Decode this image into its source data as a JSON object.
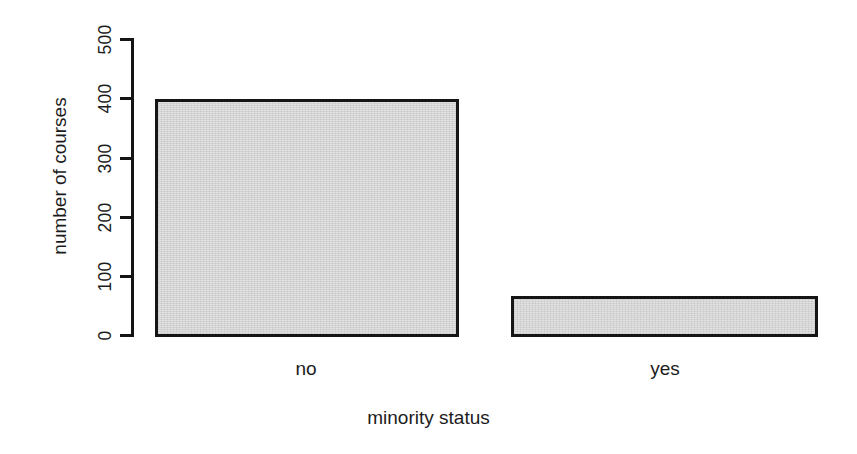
{
  "chart_data": {
    "type": "bar",
    "title": "",
    "xlabel": "minority status",
    "ylabel": "number of courses",
    "categories": [
      "no",
      "yes"
    ],
    "values": [
      400,
      69
    ],
    "ylim": [
      0,
      500
    ],
    "yticks": [
      0,
      100,
      200,
      300,
      400,
      500
    ],
    "ytick_labels": [
      "0",
      "100",
      "200",
      "300",
      "400",
      "500"
    ],
    "grid": false,
    "legend": null,
    "bar_fill_color": "#dcdcdc",
    "bar_border_color": "#151515",
    "background_color": "#ffffff",
    "axis_color": "#141414"
  },
  "axis": {
    "y_title": "number of courses",
    "x_title": "minority status"
  }
}
